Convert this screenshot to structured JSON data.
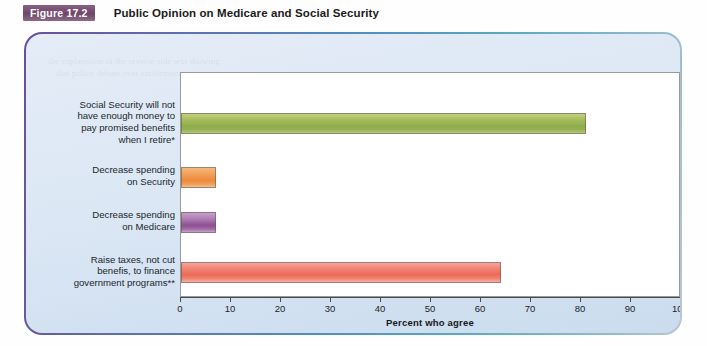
{
  "header": {
    "badge": "Figure 17.2",
    "title": "Public Opinion on Medicare and Social Security"
  },
  "chart_data": {
    "type": "bar",
    "orientation": "horizontal",
    "title": "Public Opinion on Medicare and Social Security",
    "xlabel": "Percent who agree",
    "ylabel": "",
    "xlim": [
      0,
      100
    ],
    "xticks": [
      0,
      10,
      20,
      30,
      40,
      50,
      60,
      70,
      80,
      90,
      100
    ],
    "grid": false,
    "legend": "none",
    "categories": [
      "Social Security will not have enough money to pay promised benefits when I retire*",
      "Decrease spending on Security",
      "Decrease spending on Medicare",
      "Raise taxes, not cut benefis, to finance government programs**"
    ],
    "category_lines": [
      [
        "Social Security will not",
        "have enough money to",
        "pay promised benefits",
        "when I retire*"
      ],
      [
        "Decrease spending",
        "on Security"
      ],
      [
        "Decrease spending",
        "on Medicare"
      ],
      [
        "Raise taxes, not cut",
        "benefis, to finance",
        "government programs**"
      ]
    ],
    "values": [
      81,
      7,
      7,
      64
    ],
    "colors": [
      "#8fae4a",
      "#ec8a3c",
      "#8e4f92",
      "#ec6a58"
    ]
  },
  "axis": {
    "tick_labels": [
      "0",
      "10",
      "20",
      "30",
      "40",
      "50",
      "60",
      "70",
      "80",
      "90",
      "100"
    ],
    "title": "Percent who agree"
  },
  "ghost_text": {
    "a": "the explanation of the reverse side text showing",
    "b": "that policy debate over entitlement programs",
    "c": "most Americans believe the system will",
    "d": "Medicare spending and the future of",
    "e": "government programs remains",
    "f": "taxes rather than benefit cuts"
  }
}
